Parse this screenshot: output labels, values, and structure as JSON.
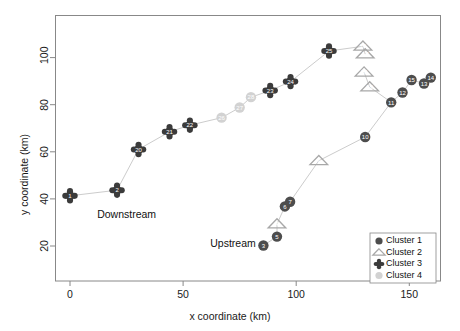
{
  "chart_data": {
    "type": "scatter",
    "title": "",
    "xlabel": "x coordinate (km)",
    "ylabel": "y coordinate (km)",
    "xlim": [
      -8,
      166
    ],
    "ylim": [
      12,
      113
    ],
    "xticks": [
      0,
      50,
      100,
      150
    ],
    "yticks": [
      20,
      40,
      60,
      80,
      100
    ],
    "grid": false,
    "legend_position": "bottom-right",
    "annotations": [
      {
        "text": "Downstream",
        "x": 12,
        "y": 33
      },
      {
        "text": "Upstream",
        "x": 62,
        "y": 21
      }
    ],
    "legend": [
      {
        "label": "Cluster 1",
        "marker": "circle",
        "color": "#4d4d4d"
      },
      {
        "label": "Cluster 2",
        "marker": "triangle",
        "color": "#a8a8a8"
      },
      {
        "label": "Cluster 3",
        "marker": "diamond-star",
        "color": "#3b3b3b"
      },
      {
        "label": "Cluster 4",
        "marker": "circle",
        "color": "#d2d2d2"
      }
    ],
    "series": [
      {
        "name": "Cluster 1",
        "marker": "circle",
        "color": "#4d4d4d",
        "points": [
          {
            "label": "3",
            "x": 85.5,
            "y": 20.2
          },
          {
            "label": "5",
            "x": 91.5,
            "y": 24.0
          },
          {
            "label": "6",
            "x": 95.0,
            "y": 36.8
          },
          {
            "label": "7",
            "x": 97.3,
            "y": 38.8
          },
          {
            "label": "10",
            "x": 130.5,
            "y": 66.3
          },
          {
            "label": "11",
            "x": 142.0,
            "y": 81.0
          },
          {
            "label": "12",
            "x": 147.0,
            "y": 85.2
          },
          {
            "label": "13",
            "x": 156.5,
            "y": 89.0
          },
          {
            "label": "14",
            "x": 159.5,
            "y": 91.5
          },
          {
            "label": "15",
            "x": 151.0,
            "y": 90.5
          }
        ]
      },
      {
        "name": "Cluster 2",
        "marker": "triangle",
        "color": "#a8a8a8",
        "points": [
          {
            "label": "4",
            "x": 91.5,
            "y": 29.3
          },
          {
            "label": "9",
            "x": 110.0,
            "y": 56.2
          },
          {
            "label": "16",
            "x": 129.5,
            "y": 104.8
          },
          {
            "label": "17",
            "x": 130.5,
            "y": 101.5
          },
          {
            "label": "18",
            "x": 130.0,
            "y": 93.8
          },
          {
            "label": "19",
            "x": 132.5,
            "y": 87.5
          }
        ]
      },
      {
        "name": "Cluster 3",
        "marker": "diamond-star",
        "color": "#3b3b3b",
        "points": [
          {
            "label": "1",
            "x": 0.0,
            "y": 41.3
          },
          {
            "label": "2",
            "x": 20.8,
            "y": 43.7
          },
          {
            "label": "20",
            "x": 30.3,
            "y": 61.0
          },
          {
            "label": "21",
            "x": 44.0,
            "y": 68.5
          },
          {
            "label": "22",
            "x": 53.0,
            "y": 71.3
          },
          {
            "label": "23",
            "x": 88.5,
            "y": 86.0
          },
          {
            "label": "24",
            "x": 97.5,
            "y": 89.8
          },
          {
            "label": "25",
            "x": 114.5,
            "y": 102.8
          }
        ]
      },
      {
        "name": "Cluster 4",
        "marker": "circle",
        "color": "#d2d2d2",
        "points": [
          {
            "label": "26",
            "x": 67.0,
            "y": 74.5
          },
          {
            "label": "27",
            "x": 75.0,
            "y": 78.8
          },
          {
            "label": "28",
            "x": 80.0,
            "y": 83.2
          }
        ]
      }
    ],
    "paths": [
      {
        "name": "downstream-main-path",
        "vertices": [
          {
            "x": 0.0,
            "y": 41.3
          },
          {
            "x": 20.8,
            "y": 43.7
          },
          {
            "x": 30.3,
            "y": 61.0
          },
          {
            "x": 44.0,
            "y": 68.5
          },
          {
            "x": 53.0,
            "y": 71.3
          },
          {
            "x": 67.0,
            "y": 74.5
          },
          {
            "x": 75.0,
            "y": 78.8
          },
          {
            "x": 80.0,
            "y": 83.2
          },
          {
            "x": 88.5,
            "y": 86.0
          },
          {
            "x": 97.5,
            "y": 89.8
          },
          {
            "x": 114.5,
            "y": 102.8
          },
          {
            "x": 129.5,
            "y": 104.8
          },
          {
            "x": 130.5,
            "y": 101.5
          }
        ]
      },
      {
        "name": "upstream-tributary-path",
        "vertices": [
          {
            "x": 85.5,
            "y": 20.2
          },
          {
            "x": 91.5,
            "y": 24.0
          },
          {
            "x": 91.5,
            "y": 29.3
          },
          {
            "x": 95.0,
            "y": 36.8
          },
          {
            "x": 97.3,
            "y": 38.8
          },
          {
            "x": 110.0,
            "y": 56.2
          },
          {
            "x": 130.5,
            "y": 66.3
          },
          {
            "x": 142.0,
            "y": 81.0
          },
          {
            "x": 147.0,
            "y": 85.2
          },
          {
            "x": 151.0,
            "y": 90.5
          },
          {
            "x": 156.5,
            "y": 89.0
          },
          {
            "x": 159.5,
            "y": 91.5
          }
        ]
      },
      {
        "name": "triangle-branch-path",
        "vertices": [
          {
            "x": 130.0,
            "y": 93.8
          },
          {
            "x": 132.5,
            "y": 87.5
          },
          {
            "x": 142.0,
            "y": 81.0
          }
        ]
      }
    ]
  },
  "style": {
    "frame_color": "#888888",
    "path_color": "#cccccc",
    "point_label_color": "#ffffff"
  }
}
